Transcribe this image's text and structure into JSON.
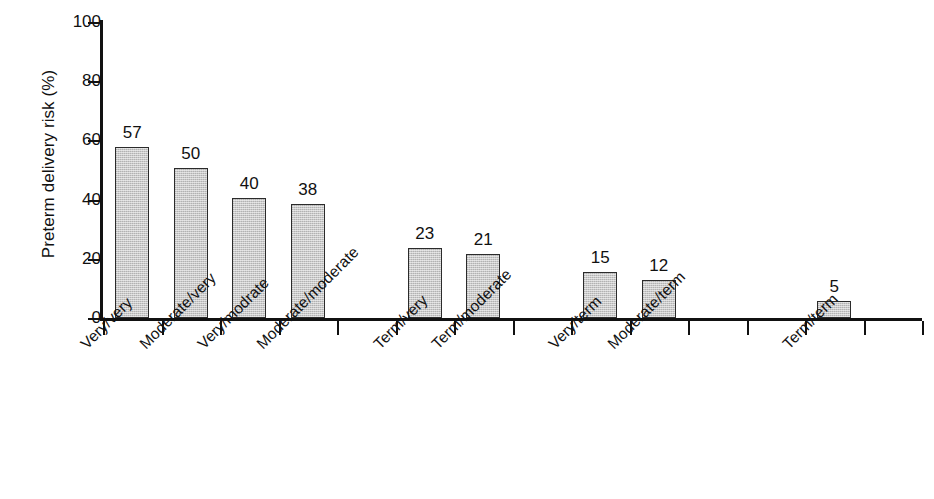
{
  "chart_data": {
    "type": "bar",
    "title": "",
    "xlabel": "",
    "ylabel": "Preterm delivery risk (%)",
    "ylim": [
      0,
      100
    ],
    "yticks": [
      0,
      20,
      40,
      60,
      80,
      100
    ],
    "grid": false,
    "legend": null,
    "categories": [
      "Very/very",
      "Moderate/very",
      "Very/modrate",
      "Moderate/moderate",
      "Term/very",
      "Term/moderate",
      "Very/term",
      "Moderate/term",
      "Term/term"
    ],
    "values": [
      57,
      50,
      40,
      38,
      23,
      21,
      15,
      12,
      5
    ],
    "value_labels": [
      "57",
      "50",
      "40",
      "38",
      "23",
      "21",
      "15",
      "12",
      "5"
    ],
    "bar_color": "#c9c9c9",
    "bar_border_color": "#2b2b2b",
    "axis_color": "#111111",
    "background_color": "#ffffff"
  },
  "axis": {
    "y_title": "Preterm delivery risk (%)",
    "y_tick_labels": [
      "100",
      "80",
      "60",
      "40",
      "20",
      "0"
    ]
  }
}
